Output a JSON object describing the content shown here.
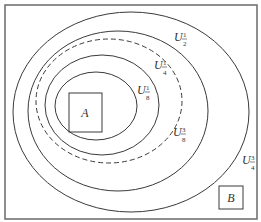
{
  "diagram": {
    "colors": {
      "stroke": "#3a3a3a",
      "frame": "#6a6a6a",
      "text": "#333333",
      "background": "#ffffff"
    },
    "sets": [
      {
        "id": "U3_4",
        "label": "U",
        "sub_num": "3",
        "sub_den": "4",
        "style": "solid"
      },
      {
        "id": "U1_2",
        "label": "U",
        "sub_num": "1",
        "sub_den": "2",
        "style": "solid"
      },
      {
        "id": "U3_8",
        "label": "U",
        "sub_num": "3",
        "sub_den": "8",
        "style": "dashed"
      },
      {
        "id": "U1_4",
        "label": "U",
        "sub_num": "1",
        "sub_den": "4",
        "style": "solid"
      },
      {
        "id": "U1_8",
        "label": "U",
        "sub_num": "1",
        "sub_den": "8",
        "style": "solid"
      }
    ],
    "boxes": [
      {
        "id": "A",
        "label": "A"
      },
      {
        "id": "B",
        "label": "B"
      }
    ]
  }
}
